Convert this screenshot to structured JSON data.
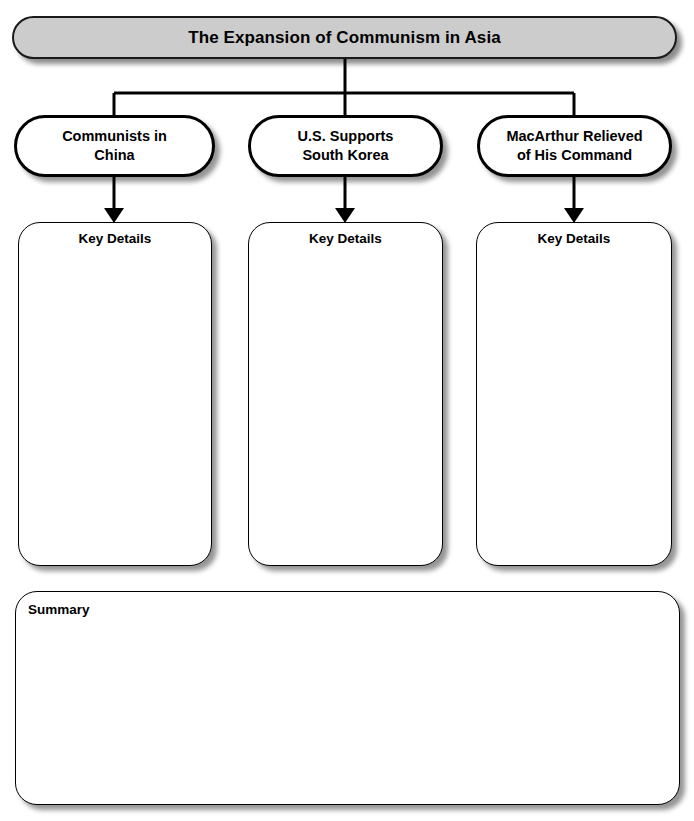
{
  "title": {
    "text": "The Expansion of Communism in Asia"
  },
  "topics": [
    {
      "label": "Communists in\nChina",
      "line1": "Communists in",
      "line2": "China"
    },
    {
      "label": "U.S. Supports\nSouth Korea",
      "line1": "U.S. Supports",
      "line2": "South Korea"
    },
    {
      "label": "MacArthur Relieved\nof His Command",
      "line1": "MacArthur Relieved",
      "line2": "of His Command"
    }
  ],
  "details": [
    {
      "label": "Key Details",
      "content": ""
    },
    {
      "label": "Key Details",
      "content": ""
    },
    {
      "label": "Key Details",
      "content": ""
    }
  ],
  "summary": {
    "label": "Summary",
    "content": ""
  },
  "colors": {
    "banner_fill": "#cccccc",
    "banner_border": "#1a1a1a",
    "box_fill": "#ffffff",
    "box_border": "#000000",
    "text": "#000000",
    "page_background": "#ffffff"
  }
}
